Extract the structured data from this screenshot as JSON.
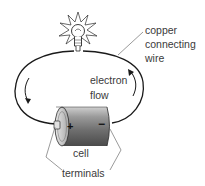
{
  "diagram": {
    "labels": {
      "wire_line1": "copper",
      "wire_line2": "connecting",
      "wire_line3": "wire",
      "flow_line1": "electron",
      "flow_line2": "flow",
      "cell": "cell",
      "terminals": "terminals",
      "positive": "+",
      "negative": "−"
    },
    "components": [
      "light-bulb",
      "copper-wire",
      "cell"
    ],
    "colors": {
      "line": "#1a1a1a",
      "text": "#3a3a3a",
      "cell_body": "#8a8a8a",
      "background": "#ffffff"
    }
  }
}
